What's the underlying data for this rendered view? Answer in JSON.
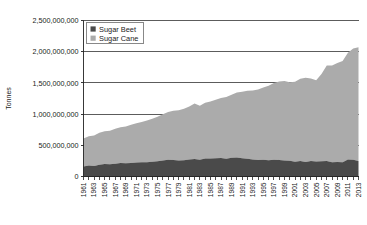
{
  "chart_data": {
    "type": "area",
    "title": "",
    "subtitle": "",
    "xlabel": "",
    "ylabel": "Tonnes",
    "stacked": true,
    "grid": true,
    "grid_axis": "y",
    "legend_position": "top-left-inside",
    "ylim": [
      0,
      2500000000
    ],
    "ytick_values": [
      0,
      500000000,
      1000000000,
      1500000000,
      2000000000,
      2500000000
    ],
    "ytick_labels": [
      "0",
      "500,000,000",
      "1,000,000,000",
      "1,500,000,000",
      "2,000,000,000",
      "2,500,000,000"
    ],
    "xlim": [
      1961,
      2013
    ],
    "x": [
      1961,
      1962,
      1963,
      1964,
      1965,
      1966,
      1967,
      1968,
      1969,
      1970,
      1971,
      1972,
      1973,
      1974,
      1975,
      1976,
      1977,
      1978,
      1979,
      1980,
      1981,
      1982,
      1983,
      1984,
      1985,
      1986,
      1987,
      1988,
      1989,
      1990,
      1991,
      1992,
      1993,
      1994,
      1995,
      1996,
      1997,
      1998,
      1999,
      2000,
      2001,
      2002,
      2003,
      2004,
      2005,
      2006,
      2007,
      2008,
      2009,
      2010,
      2011,
      2012,
      2013
    ],
    "xtick_labels": [
      "1961",
      "1963",
      "1965",
      "1967",
      "1969",
      "1971",
      "1973",
      "1975",
      "1977",
      "1979",
      "1981",
      "1983",
      "1985",
      "1987",
      "1989",
      "1991",
      "1993",
      "1995",
      "1997",
      "1999",
      "2001",
      "2003",
      "2005",
      "2007",
      "2009",
      "2011",
      "2013"
    ],
    "series": [
      {
        "name": "Sugar Beet",
        "color": "#4a4a4a",
        "values": [
          160000000,
          175000000,
          168000000,
          190000000,
          200000000,
          195000000,
          205000000,
          215000000,
          212000000,
          218000000,
          224000000,
          230000000,
          228000000,
          236000000,
          245000000,
          258000000,
          270000000,
          264000000,
          258000000,
          262000000,
          272000000,
          280000000,
          268000000,
          290000000,
          288000000,
          292000000,
          296000000,
          285000000,
          300000000,
          305000000,
          292000000,
          285000000,
          272000000,
          265000000,
          268000000,
          262000000,
          270000000,
          264000000,
          258000000,
          252000000,
          238000000,
          248000000,
          234000000,
          250000000,
          242000000,
          246000000,
          250000000,
          228000000,
          232000000,
          230000000,
          272000000,
          268000000,
          250000000
        ]
      },
      {
        "name": "Sugar Cane",
        "color": "#ababab",
        "values": [
          448000000,
          470000000,
          490000000,
          512000000,
          525000000,
          538000000,
          560000000,
          575000000,
          590000000,
          612000000,
          630000000,
          645000000,
          668000000,
          690000000,
          712000000,
          738000000,
          762000000,
          790000000,
          802000000,
          822000000,
          848000000,
          888000000,
          866000000,
          890000000,
          912000000,
          938000000,
          962000000,
          988000000,
          1010000000,
          1042000000,
          1068000000,
          1090000000,
          1108000000,
          1128000000,
          1160000000,
          1192000000,
          1228000000,
          1258000000,
          1272000000,
          1258000000,
          1282000000,
          1318000000,
          1348000000,
          1322000000,
          1300000000,
          1396000000,
          1528000000,
          1552000000,
          1588000000,
          1620000000,
          1712000000,
          1782000000,
          1820000000
        ]
      }
    ],
    "legend": [
      {
        "label": "Sugar Beet",
        "color": "#4a4a4a"
      },
      {
        "label": "Sugar Cane",
        "color": "#ababab"
      }
    ]
  }
}
